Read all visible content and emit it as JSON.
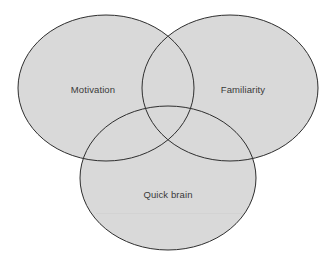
{
  "diagram": {
    "type": "venn",
    "colors": {
      "background": "#ffffff",
      "fill": "#d9d9d9",
      "stroke": "#2e2e2e",
      "label": "#3a3a3a"
    },
    "sets": [
      {
        "id": "motivation",
        "label": "Motivation",
        "cx": 106,
        "cy": 88,
        "rx": 88,
        "ry": 73,
        "label_x": 93,
        "label_y": 89
      },
      {
        "id": "familiarity",
        "label": "Familiarity",
        "cx": 230,
        "cy": 88,
        "rx": 88,
        "ry": 73,
        "label_x": 243,
        "label_y": 89
      },
      {
        "id": "quick-brain",
        "label": "Quick brain",
        "cx": 168,
        "cy": 178,
        "rx": 88,
        "ry": 72,
        "label_x": 168,
        "label_y": 194
      }
    ]
  }
}
